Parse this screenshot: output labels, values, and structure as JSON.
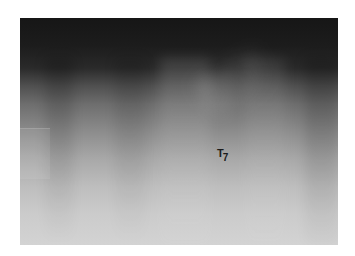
{
  "image": {
    "type": "radiograph",
    "description": "Grayscale X-ray image, dark at top fading to light at bottom",
    "label": {
      "main": "T",
      "subscript": "7"
    },
    "colors": {
      "top": "#161616",
      "bottom": "#d3d3d3",
      "label": "#1a1a1a",
      "background": "#ffffff"
    }
  }
}
